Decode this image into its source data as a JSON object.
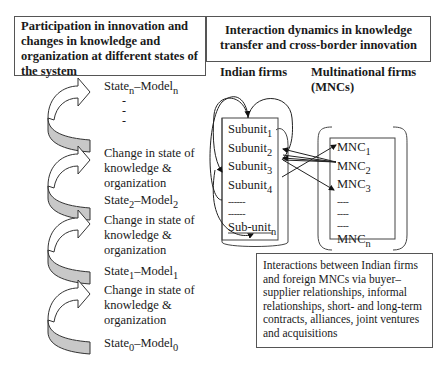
{
  "left_panel": {
    "header": "Participation in innovation and changes in knowledge and organization at different states of the system",
    "states": [
      {
        "label": "State",
        "sub": "n",
        "model": "Model",
        "model_sub": "n"
      },
      {
        "label": "State",
        "sub": "2",
        "model": "Model",
        "model_sub": "2"
      },
      {
        "label": "State",
        "sub": "1",
        "model": "Model",
        "model_sub": "1"
      },
      {
        "label": "State",
        "sub": "0",
        "model": "Model",
        "model_sub": "0"
      }
    ],
    "ellipsis": [
      "-",
      "-",
      "-"
    ],
    "change_text": [
      "Change in state of",
      "knowledge &",
      "organization"
    ],
    "arrow_fill": "#c8c8c8"
  },
  "right_panel": {
    "header": "Interaction dynamics in knowledge transfer and cross-border innovation",
    "indian_firms": {
      "title": "Indian firms",
      "subunits": [
        {
          "label": "Subunit",
          "sub": "1"
        },
        {
          "label": "Subunit",
          "sub": "2"
        },
        {
          "label": "Subunit",
          "sub": "3"
        },
        {
          "label": "Subunit",
          "sub": "4"
        }
      ],
      "dashes": [
        "------",
        "------"
      ],
      "last": {
        "label": "Sub-unit",
        "sub": "n"
      }
    },
    "mncs": {
      "title_line1": "Multinational firms",
      "title_line2": "(MNCs)",
      "items": [
        {
          "label": "MNC",
          "sub": "1"
        },
        {
          "label": "MNC",
          "sub": "2"
        },
        {
          "label": "MNC",
          "sub": "3"
        }
      ],
      "dashes": [
        "----",
        "----",
        "----"
      ],
      "last": {
        "label": "MNC",
        "sub": "n"
      }
    },
    "note": "Interactions between Indian firms and foreign MNCs via buyer–supplier relationships, informal relationships, short- and long-term contracts, alliances, joint ventures and acquisitions"
  }
}
